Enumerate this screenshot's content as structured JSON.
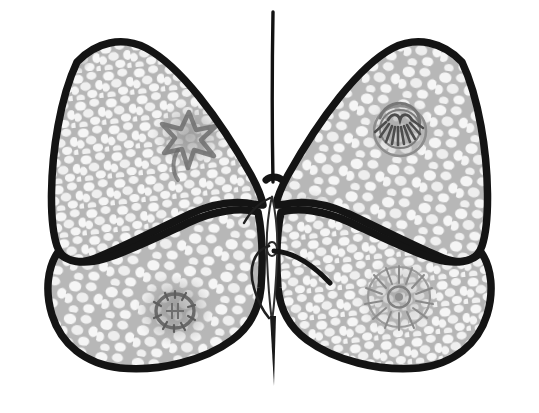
{
  "image": {
    "title": "Butterfly line drawing with mottled wings",
    "subject": "butterfly",
    "style": "hand-drawn ink outline with pencil-shaded reticulated wing fill",
    "width": 539,
    "height": 413,
    "background_color": "#ffffff",
    "caption": "Butterfly line drawing with mottled wings"
  },
  "palette": {
    "background": "#ffffff",
    "outline": "#141414",
    "wing_fill": "#b9b9b9",
    "wing_cell": "#f4f4f4",
    "spot_gray": "#a0a0a0",
    "spot_dark": "#5f5f5f",
    "smudge_gray": "#9a9a9a",
    "body_line": "#2a2a2a"
  },
  "parts": [
    {
      "id": "left-forewing",
      "name": "Left forewing",
      "side": "left",
      "position": "upper-left",
      "fill": "#b9b9b9",
      "outline_width_px": 7,
      "texture": "cobblestone-reticulate"
    },
    {
      "id": "right-forewing",
      "name": "Right forewing",
      "side": "right",
      "position": "upper-right",
      "fill": "#b9b9b9",
      "outline_width_px": 7,
      "texture": "cobblestone-reticulate"
    },
    {
      "id": "left-hindwing",
      "name": "Left hindwing",
      "side": "left",
      "position": "lower-left",
      "fill": "#b9b9b9",
      "outline_width_px": 7,
      "texture": "cobblestone-reticulate"
    },
    {
      "id": "right-hindwing",
      "name": "Right hindwing",
      "side": "right",
      "position": "lower-right",
      "fill": "#b9b9b9",
      "outline_width_px": 7,
      "texture": "cobblestone-reticulate"
    },
    {
      "id": "body",
      "name": "Body / abdomen",
      "side": "center",
      "position": "center",
      "fill": "#ffffff",
      "outline_width_px": 2,
      "texture": "none"
    },
    {
      "id": "antenna",
      "name": "Vertical antenna line",
      "side": "center",
      "position": "top-center",
      "fill": "none",
      "outline_width_px": 3,
      "texture": "none"
    },
    {
      "id": "tail-line",
      "name": "Tapered tail line",
      "side": "center",
      "position": "bottom-center",
      "fill": "#1a1a1a",
      "outline_width_px": 2,
      "texture": "none"
    },
    {
      "id": "leg-stroke",
      "name": "Diagonal leg stroke",
      "side": "center-right",
      "position": "center",
      "fill": "none",
      "outline_width_px": 4,
      "texture": "none"
    }
  ],
  "markings": [
    {
      "id": "marking-upper-left-star",
      "name": "Star-shaped gray marking",
      "wing": "left-forewing",
      "shape": "star",
      "cx": 189,
      "cy": 133,
      "r": 32,
      "halo_color": "#a6a6a6",
      "core_color": "#8a8a8a"
    },
    {
      "id": "marking-upper-right-eyespot",
      "name": "Dark eyespot with spiky center",
      "wing": "right-forewing",
      "shape": "eyespot",
      "cx": 400,
      "cy": 129,
      "r": 28,
      "halo_color": "#b0b0b0",
      "core_color": "#4a4a4a"
    },
    {
      "id": "marking-lower-left-blot",
      "name": "Gray blot with dark center",
      "wing": "left-hindwing",
      "shape": "blot",
      "cx": 175,
      "cy": 310,
      "r": 34,
      "halo_color": "#a3a3a3",
      "core_color": "#6e6e6e"
    },
    {
      "id": "marking-lower-right-rosette",
      "name": "Radial sunburst rosette",
      "wing": "right-hindwing",
      "shape": "rosette",
      "cx": 399,
      "cy": 297,
      "r": 36,
      "halo_color": "#b2b2b2",
      "core_color": "#8c8c8c"
    },
    {
      "id": "marking-apex-smudge",
      "name": "Dark smudge near left apex",
      "wing": "left-forewing",
      "shape": "smudge",
      "cx": 74,
      "cy": 56,
      "r": 16,
      "halo_color": "#8e8e8e",
      "core_color": "#7a7a7a"
    },
    {
      "id": "marking-inner-smudge",
      "name": "Faint smudge beside body",
      "wing": "right-forewing",
      "shape": "smudge",
      "cx": 308,
      "cy": 213,
      "r": 26,
      "halo_color": "#a8a8a8",
      "core_color": "#9a9a9a"
    }
  ]
}
